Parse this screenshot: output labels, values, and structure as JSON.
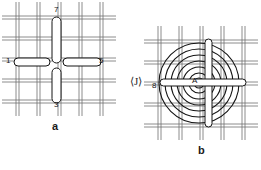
{
  "figure": {
    "panels": [
      {
        "id": "a",
        "caption": "a",
        "description": "woven mesh with straight bar elements",
        "labels": [
          {
            "id": "label-7",
            "text": "7"
          },
          {
            "id": "label-3",
            "text": "3"
          },
          {
            "id": "label-1",
            "text": "1"
          },
          {
            "id": "label-5",
            "text": "5"
          }
        ]
      },
      {
        "id": "b",
        "caption": "b",
        "description": "woven mesh with concentric spiral coil and cross bars",
        "labels": [
          {
            "id": "label-8",
            "text": "8"
          },
          {
            "id": "label-A",
            "text": "A"
          },
          {
            "id": "marker-j",
            "text": "⟨J⟩"
          }
        ]
      }
    ],
    "colors": {
      "ink": "#1a1a1a",
      "mesh": "#6e6e6e",
      "background": "#ffffff"
    }
  }
}
